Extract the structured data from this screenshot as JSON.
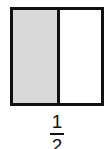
{
  "diagram": {
    "type": "fraction-model",
    "parts_total": 2,
    "parts_shaded": 1,
    "colors": {
      "outline": "#111111",
      "shaded": "#d9d9d9",
      "unshaded": "#ffffff"
    }
  },
  "fraction": {
    "numerator": "1",
    "denominator": "2"
  }
}
